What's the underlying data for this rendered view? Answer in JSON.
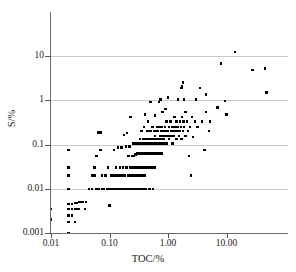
{
  "chart_data": {
    "type": "scatter",
    "title": "",
    "xlabel": "TOC/%",
    "ylabel": "S/%",
    "xscale": "log",
    "yscale": "log",
    "xlim": [
      0.0075,
      80
    ],
    "ylim": [
      0.001,
      30
    ],
    "grid": "horizontal",
    "legend": "none",
    "xticks": [
      0.01,
      0.1,
      1,
      10
    ],
    "xticklabels": [
      "0.01",
      "0.10",
      "1.00",
      "10.00"
    ],
    "yticks": [
      0.001,
      0.01,
      0.1,
      1,
      10
    ],
    "yticklabels": [
      "0.001",
      "0.01",
      "0.1",
      "1",
      "10"
    ],
    "marker": "square",
    "marker_color": "#000000",
    "points": [
      [
        0.01,
        0.0035
      ],
      [
        0.01,
        0.002
      ],
      [
        0.02,
        0.075
      ],
      [
        0.02,
        0.02
      ],
      [
        0.02,
        0.03
      ],
      [
        0.02,
        0.01
      ],
      [
        0.02,
        0.0045
      ],
      [
        0.02,
        0.0035
      ],
      [
        0.02,
        0.0025
      ],
      [
        0.02,
        0.0018
      ],
      [
        0.02,
        0.001
      ],
      [
        0.023,
        0.0045
      ],
      [
        0.023,
        0.0035
      ],
      [
        0.023,
        0.0025
      ],
      [
        0.026,
        0.0048
      ],
      [
        0.026,
        0.0035
      ],
      [
        0.026,
        0.0018
      ],
      [
        0.028,
        0.0048
      ],
      [
        0.028,
        0.0035
      ],
      [
        0.03,
        0.005
      ],
      [
        0.03,
        0.0035
      ],
      [
        0.032,
        0.005
      ],
      [
        0.035,
        0.005
      ],
      [
        0.038,
        0.0035
      ],
      [
        0.04,
        0.005
      ],
      [
        0.045,
        0.01
      ],
      [
        0.05,
        0.02
      ],
      [
        0.05,
        0.01
      ],
      [
        0.055,
        0.02
      ],
      [
        0.055,
        0.03
      ],
      [
        0.06,
        0.01
      ],
      [
        0.06,
        0.055
      ],
      [
        0.065,
        0.185
      ],
      [
        0.065,
        0.01
      ],
      [
        0.07,
        0.185
      ],
      [
        0.07,
        0.075
      ],
      [
        0.075,
        0.02
      ],
      [
        0.075,
        0.01
      ],
      [
        0.08,
        0.01
      ],
      [
        0.085,
        0.02
      ],
      [
        0.09,
        0.01
      ],
      [
        0.095,
        0.03
      ],
      [
        0.1,
        0.01
      ],
      [
        0.1,
        0.0042
      ],
      [
        0.105,
        0.02
      ],
      [
        0.11,
        0.01
      ],
      [
        0.115,
        0.02
      ],
      [
        0.12,
        0.01
      ],
      [
        0.12,
        0.075
      ],
      [
        0.125,
        0.02
      ],
      [
        0.13,
        0.01
      ],
      [
        0.13,
        0.03
      ],
      [
        0.135,
        0.02
      ],
      [
        0.14,
        0.01
      ],
      [
        0.14,
        0.085
      ],
      [
        0.145,
        0.02
      ],
      [
        0.15,
        0.01
      ],
      [
        0.15,
        0.03
      ],
      [
        0.155,
        0.02
      ],
      [
        0.16,
        0.01
      ],
      [
        0.16,
        0.085
      ],
      [
        0.165,
        0.02
      ],
      [
        0.17,
        0.01
      ],
      [
        0.17,
        0.03
      ],
      [
        0.175,
        0.02
      ],
      [
        0.175,
        0.165
      ],
      [
        0.18,
        0.01
      ],
      [
        0.185,
        0.02
      ],
      [
        0.19,
        0.01
      ],
      [
        0.19,
        0.09
      ],
      [
        0.195,
        0.03
      ],
      [
        0.2,
        0.01
      ],
      [
        0.2,
        0.18
      ],
      [
        0.205,
        0.02
      ],
      [
        0.21,
        0.01
      ],
      [
        0.21,
        0.055
      ],
      [
        0.215,
        0.02
      ],
      [
        0.22,
        0.01
      ],
      [
        0.22,
        0.09
      ],
      [
        0.225,
        0.03
      ],
      [
        0.23,
        0.01
      ],
      [
        0.23,
        0.42
      ],
      [
        0.235,
        0.02
      ],
      [
        0.24,
        0.01
      ],
      [
        0.24,
        0.055
      ],
      [
        0.245,
        0.03
      ],
      [
        0.25,
        0.01
      ],
      [
        0.25,
        0.105
      ],
      [
        0.255,
        0.02
      ],
      [
        0.26,
        0.01
      ],
      [
        0.26,
        0.055
      ],
      [
        0.265,
        0.03
      ],
      [
        0.27,
        0.01
      ],
      [
        0.27,
        0.105
      ],
      [
        0.275,
        0.02
      ],
      [
        0.28,
        0.01
      ],
      [
        0.28,
        0.06
      ],
      [
        0.285,
        0.03
      ],
      [
        0.29,
        0.01
      ],
      [
        0.29,
        0.105
      ],
      [
        0.295,
        0.02
      ],
      [
        0.3,
        0.01
      ],
      [
        0.3,
        0.062
      ],
      [
        0.305,
        0.03
      ],
      [
        0.31,
        0.105
      ],
      [
        0.315,
        0.02
      ],
      [
        0.32,
        0.01
      ],
      [
        0.32,
        0.062
      ],
      [
        0.325,
        0.03
      ],
      [
        0.33,
        0.105
      ],
      [
        0.335,
        0.135
      ],
      [
        0.34,
        0.01
      ],
      [
        0.34,
        0.062
      ],
      [
        0.345,
        0.03
      ],
      [
        0.35,
        0.105
      ],
      [
        0.35,
        0.2
      ],
      [
        0.355,
        0.02
      ],
      [
        0.36,
        0.062
      ],
      [
        0.365,
        0.03
      ],
      [
        0.37,
        0.105
      ],
      [
        0.375,
        0.135
      ],
      [
        0.38,
        0.01
      ],
      [
        0.38,
        0.062
      ],
      [
        0.385,
        0.03
      ],
      [
        0.39,
        0.105
      ],
      [
        0.39,
        0.25
      ],
      [
        0.395,
        0.02
      ],
      [
        0.4,
        0.062
      ],
      [
        0.4,
        0.48
      ],
      [
        0.405,
        0.03
      ],
      [
        0.41,
        0.105
      ],
      [
        0.415,
        0.135
      ],
      [
        0.42,
        0.01
      ],
      [
        0.42,
        0.062
      ],
      [
        0.425,
        0.03
      ],
      [
        0.43,
        0.105
      ],
      [
        0.435,
        0.2
      ],
      [
        0.44,
        0.062
      ],
      [
        0.445,
        0.03
      ],
      [
        0.45,
        0.105
      ],
      [
        0.45,
        0.33
      ],
      [
        0.455,
        0.135
      ],
      [
        0.46,
        0.062
      ],
      [
        0.465,
        0.03
      ],
      [
        0.47,
        0.105
      ],
      [
        0.475,
        0.2
      ],
      [
        0.48,
        0.062
      ],
      [
        0.48,
        0.01
      ],
      [
        0.485,
        0.03
      ],
      [
        0.49,
        0.105
      ],
      [
        0.495,
        0.135
      ],
      [
        0.5,
        0.062
      ],
      [
        0.5,
        0.9
      ],
      [
        0.505,
        0.03
      ],
      [
        0.51,
        0.105
      ],
      [
        0.515,
        0.2
      ],
      [
        0.52,
        0.062
      ],
      [
        0.525,
        0.03
      ],
      [
        0.53,
        0.105
      ],
      [
        0.535,
        0.135
      ],
      [
        0.54,
        0.062
      ],
      [
        0.545,
        0.25
      ],
      [
        0.55,
        0.105
      ],
      [
        0.55,
        0.01
      ],
      [
        0.555,
        0.03
      ],
      [
        0.56,
        0.062
      ],
      [
        0.565,
        0.135
      ],
      [
        0.57,
        0.105
      ],
      [
        0.575,
        0.2
      ],
      [
        0.58,
        0.062
      ],
      [
        0.585,
        0.03
      ],
      [
        0.59,
        0.105
      ],
      [
        0.595,
        0.155
      ],
      [
        0.6,
        0.062
      ],
      [
        0.6,
        0.45
      ],
      [
        0.61,
        0.105
      ],
      [
        0.62,
        0.2
      ],
      [
        0.625,
        0.062
      ],
      [
        0.63,
        0.135
      ],
      [
        0.64,
        0.105
      ],
      [
        0.65,
        0.25
      ],
      [
        0.65,
        0.062
      ],
      [
        0.66,
        0.135
      ],
      [
        0.67,
        0.105
      ],
      [
        0.68,
        0.2
      ],
      [
        0.69,
        0.062
      ],
      [
        0.7,
        0.135
      ],
      [
        0.7,
        0.9
      ],
      [
        0.71,
        0.105
      ],
      [
        0.72,
        0.25
      ],
      [
        0.73,
        0.062
      ],
      [
        0.74,
        0.155
      ],
      [
        0.75,
        0.105
      ],
      [
        0.75,
        1.05
      ],
      [
        0.76,
        0.2
      ],
      [
        0.77,
        0.135
      ],
      [
        0.78,
        0.062
      ],
      [
        0.79,
        0.25
      ],
      [
        0.8,
        0.105
      ],
      [
        0.8,
        0.55
      ],
      [
        0.82,
        0.155
      ],
      [
        0.84,
        0.2
      ],
      [
        0.85,
        0.105
      ],
      [
        0.86,
        0.135
      ],
      [
        0.88,
        0.25
      ],
      [
        0.9,
        0.155
      ],
      [
        0.9,
        0.64
      ],
      [
        0.92,
        0.2
      ],
      [
        0.95,
        0.105
      ],
      [
        0.95,
        0.33
      ],
      [
        0.98,
        0.155
      ],
      [
        1.0,
        0.2
      ],
      [
        1.0,
        1.15
      ],
      [
        1.05,
        0.25
      ],
      [
        1.05,
        0.135
      ],
      [
        1.1,
        0.33
      ],
      [
        1.1,
        0.155
      ],
      [
        1.15,
        0.2
      ],
      [
        1.2,
        0.25
      ],
      [
        1.2,
        0.105
      ],
      [
        1.25,
        0.155
      ],
      [
        1.3,
        0.2
      ],
      [
        1.3,
        0.42
      ],
      [
        1.35,
        0.25
      ],
      [
        1.4,
        0.135
      ],
      [
        1.4,
        0.33
      ],
      [
        1.45,
        0.2
      ],
      [
        1.5,
        0.25
      ],
      [
        1.5,
        1.05
      ],
      [
        1.55,
        0.155
      ],
      [
        1.6,
        0.33
      ],
      [
        1.6,
        0.2
      ],
      [
        1.65,
        0.25
      ],
      [
        1.7,
        1.9
      ],
      [
        1.7,
        0.135
      ],
      [
        1.75,
        2.05
      ],
      [
        1.75,
        0.42
      ],
      [
        1.8,
        2.5
      ],
      [
        1.8,
        0.2
      ],
      [
        1.85,
        0.33
      ],
      [
        1.9,
        1.05
      ],
      [
        1.9,
        0.25
      ],
      [
        2.0,
        0.155
      ],
      [
        2.0,
        0.55
      ],
      [
        2.1,
        0.33
      ],
      [
        2.2,
        0.2
      ],
      [
        2.3,
        0.055
      ],
      [
        2.4,
        0.25
      ],
      [
        2.5,
        0.02
      ],
      [
        2.6,
        0.42
      ],
      [
        2.7,
        0.15
      ],
      [
        2.9,
        0.33
      ],
      [
        3.0,
        1.05
      ],
      [
        3.2,
        0.25
      ],
      [
        3.5,
        1.9
      ],
      [
        3.8,
        0.33
      ],
      [
        4.2,
        0.075
      ],
      [
        4.5,
        1.35
      ],
      [
        4.5,
        0.55
      ],
      [
        5.0,
        0.2
      ],
      [
        5.2,
        0.33
      ],
      [
        7.0,
        0.68
      ],
      [
        8.0,
        6.8
      ],
      [
        9.5,
        0.95
      ],
      [
        10.0,
        0.48
      ],
      [
        14.0,
        12.5
      ],
      [
        28.0,
        4.8
      ],
      [
        45.0,
        5.2
      ],
      [
        48.0,
        1.5
      ]
    ]
  },
  "axes": {
    "x_title": "TOC/%",
    "y_title": "S/%"
  }
}
